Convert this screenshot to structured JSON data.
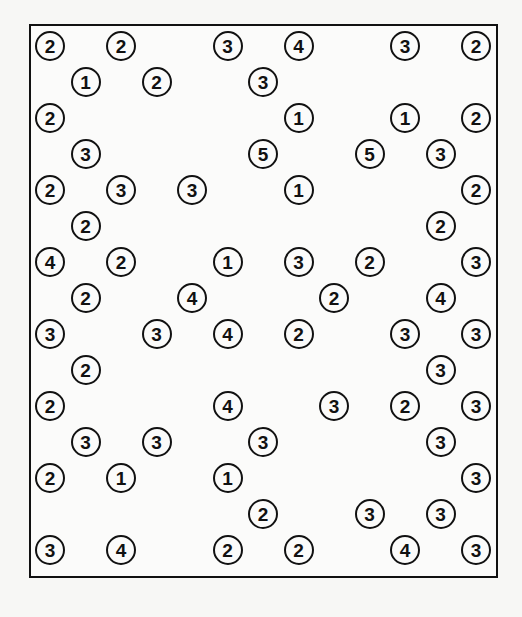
{
  "puzzle": {
    "type": "hashiwokakero",
    "columns": 13,
    "rows": 15,
    "colors": {
      "border": "#111111",
      "background": "#fbfbfa"
    },
    "islands": [
      {
        "r": 0,
        "c": 0,
        "n": "2"
      },
      {
        "r": 0,
        "c": 2,
        "n": "2"
      },
      {
        "r": 0,
        "c": 5,
        "n": "3"
      },
      {
        "r": 0,
        "c": 7,
        "n": "4"
      },
      {
        "r": 0,
        "c": 10,
        "n": "3"
      },
      {
        "r": 0,
        "c": 12,
        "n": "2"
      },
      {
        "r": 1,
        "c": 1,
        "n": "1"
      },
      {
        "r": 1,
        "c": 3,
        "n": "2"
      },
      {
        "r": 1,
        "c": 6,
        "n": "3"
      },
      {
        "r": 2,
        "c": 0,
        "n": "2"
      },
      {
        "r": 2,
        "c": 7,
        "n": "1"
      },
      {
        "r": 2,
        "c": 10,
        "n": "1"
      },
      {
        "r": 2,
        "c": 12,
        "n": "2"
      },
      {
        "r": 3,
        "c": 1,
        "n": "3"
      },
      {
        "r": 3,
        "c": 6,
        "n": "5"
      },
      {
        "r": 3,
        "c": 9,
        "n": "5"
      },
      {
        "r": 3,
        "c": 11,
        "n": "3"
      },
      {
        "r": 4,
        "c": 0,
        "n": "2"
      },
      {
        "r": 4,
        "c": 2,
        "n": "3"
      },
      {
        "r": 4,
        "c": 4,
        "n": "3"
      },
      {
        "r": 4,
        "c": 7,
        "n": "1"
      },
      {
        "r": 4,
        "c": 12,
        "n": "2"
      },
      {
        "r": 5,
        "c": 1,
        "n": "2"
      },
      {
        "r": 5,
        "c": 11,
        "n": "2"
      },
      {
        "r": 6,
        "c": 0,
        "n": "4"
      },
      {
        "r": 6,
        "c": 2,
        "n": "2"
      },
      {
        "r": 6,
        "c": 5,
        "n": "1"
      },
      {
        "r": 6,
        "c": 7,
        "n": "3"
      },
      {
        "r": 6,
        "c": 9,
        "n": "2"
      },
      {
        "r": 6,
        "c": 12,
        "n": "3"
      },
      {
        "r": 7,
        "c": 1,
        "n": "2"
      },
      {
        "r": 7,
        "c": 4,
        "n": "4"
      },
      {
        "r": 7,
        "c": 8,
        "n": "2"
      },
      {
        "r": 7,
        "c": 11,
        "n": "4"
      },
      {
        "r": 8,
        "c": 0,
        "n": "3"
      },
      {
        "r": 8,
        "c": 3,
        "n": "3"
      },
      {
        "r": 8,
        "c": 5,
        "n": "4"
      },
      {
        "r": 8,
        "c": 7,
        "n": "2"
      },
      {
        "r": 8,
        "c": 10,
        "n": "3"
      },
      {
        "r": 8,
        "c": 12,
        "n": "3"
      },
      {
        "r": 9,
        "c": 1,
        "n": "2"
      },
      {
        "r": 9,
        "c": 11,
        "n": "3"
      },
      {
        "r": 10,
        "c": 0,
        "n": "2"
      },
      {
        "r": 10,
        "c": 5,
        "n": "4"
      },
      {
        "r": 10,
        "c": 8,
        "n": "3"
      },
      {
        "r": 10,
        "c": 10,
        "n": "2"
      },
      {
        "r": 10,
        "c": 12,
        "n": "3"
      },
      {
        "r": 11,
        "c": 1,
        "n": "3"
      },
      {
        "r": 11,
        "c": 3,
        "n": "3"
      },
      {
        "r": 11,
        "c": 6,
        "n": "3"
      },
      {
        "r": 11,
        "c": 11,
        "n": "3"
      },
      {
        "r": 12,
        "c": 0,
        "n": "2"
      },
      {
        "r": 12,
        "c": 2,
        "n": "1"
      },
      {
        "r": 12,
        "c": 5,
        "n": "1"
      },
      {
        "r": 12,
        "c": 12,
        "n": "3"
      },
      {
        "r": 13,
        "c": 6,
        "n": "2"
      },
      {
        "r": 13,
        "c": 9,
        "n": "3"
      },
      {
        "r": 13,
        "c": 11,
        "n": "3"
      },
      {
        "r": 14,
        "c": 0,
        "n": "3"
      },
      {
        "r": 14,
        "c": 2,
        "n": "4"
      },
      {
        "r": 14,
        "c": 5,
        "n": "2"
      },
      {
        "r": 14,
        "c": 7,
        "n": "2"
      },
      {
        "r": 14,
        "c": 10,
        "n": "4"
      },
      {
        "r": 14,
        "c": 12,
        "n": "3"
      }
    ]
  }
}
